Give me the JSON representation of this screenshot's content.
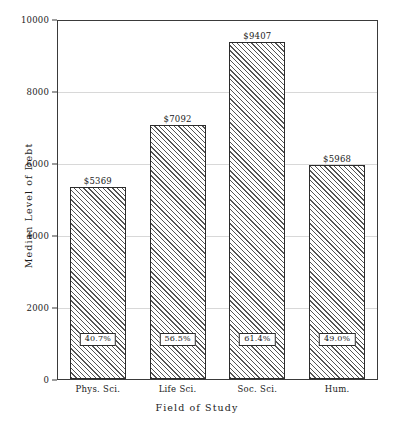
{
  "chart_data": {
    "type": "bar",
    "title": "",
    "xlabel": "Field of Study",
    "ylabel": "Median Level of Debt",
    "categories": [
      "Phys. Sci.",
      "Life Sci.",
      "Soc. Sci.",
      "Hum."
    ],
    "values": [
      5369,
      7092,
      9407,
      5968
    ],
    "value_labels": [
      "$5369",
      "$7092",
      "$9407",
      "$5968"
    ],
    "percent_labels": [
      "40.7%",
      "56.5%",
      "61.4%",
      "49.0%"
    ],
    "percent_values": [
      40.7,
      56.5,
      61.4,
      49.0
    ],
    "ylim": [
      0,
      10000
    ],
    "yticks": [
      0,
      2000,
      4000,
      6000,
      8000,
      10000
    ],
    "ytick_labels": [
      "0",
      "2000",
      "4000",
      "6000",
      "8000",
      "10000"
    ],
    "grid": true,
    "legend": "none",
    "bar_fill": "diagonal-hatch",
    "colors": {
      "bar_edge": "#2b2b2b",
      "bar_hatch": "#555555",
      "frame": "#3a3a3a",
      "gridline": "#d8d8d8",
      "text": "#1a1a1a",
      "background": "#ffffff"
    }
  }
}
